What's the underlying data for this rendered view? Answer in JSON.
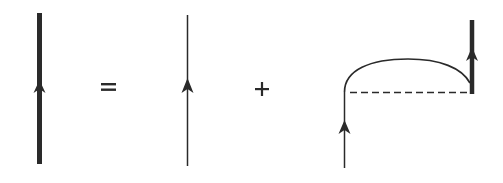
{
  "diagram": {
    "colors": {
      "line": "#2a2a2a",
      "background": "#ffffff"
    },
    "terms": [
      {
        "id": "dressed-propagator",
        "kind": "thick-line",
        "description": "Full (dressed) propagator with upward arrow"
      },
      {
        "id": "equals",
        "kind": "operator",
        "symbol": "="
      },
      {
        "id": "bare-propagator",
        "kind": "thin-line",
        "description": "Bare propagator with upward arrow"
      },
      {
        "id": "plus",
        "kind": "operator",
        "symbol": "+"
      },
      {
        "id": "self-energy-term",
        "kind": "composite",
        "description": "Bare propagator entering from below, arc (propagator) over a dashed interaction line, connected to dressed propagator exiting upward"
      }
    ],
    "operators": {
      "equals": "=",
      "plus": "+"
    }
  }
}
